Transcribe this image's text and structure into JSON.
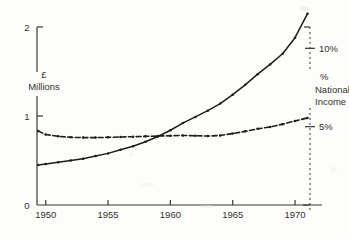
{
  "chart_data": {
    "type": "line",
    "title": "",
    "xlabel": "",
    "ylabel": "£ Millions",
    "y2label": "% National Income",
    "xlim": [
      1949.3,
      1971.2
    ],
    "ylim": [
      0,
      2
    ],
    "y2lim": [
      0,
      11.36
    ],
    "grid": false,
    "legend": "none",
    "xticks": [
      "1950",
      "1955",
      "1960",
      "1965",
      "1970"
    ],
    "xtick_values": [
      1950,
      1955,
      1960,
      1965,
      1970
    ],
    "yticks": [
      "0",
      "1",
      "2"
    ],
    "ytick_values": [
      0,
      1,
      2
    ],
    "y2ticks": [
      "5%",
      "10%"
    ],
    "y2tick_values": [
      5,
      10
    ],
    "series": [
      {
        "name": "£ Millions",
        "axis": "left",
        "style": "solid",
        "marker": "dot",
        "x": [
          1949.4,
          1950,
          1951,
          1952,
          1953,
          1954,
          1955,
          1956,
          1957,
          1958,
          1959,
          1960,
          1961,
          1962,
          1963,
          1964,
          1965,
          1966,
          1967,
          1968,
          1969,
          1970,
          1971
        ],
        "values": [
          0.45,
          0.46,
          0.48,
          0.5,
          0.52,
          0.55,
          0.58,
          0.62,
          0.66,
          0.71,
          0.77,
          0.84,
          0.92,
          0.99,
          1.06,
          1.14,
          1.24,
          1.35,
          1.47,
          1.58,
          1.7,
          1.88,
          2.15
        ]
      },
      {
        "name": "% National Income",
        "axis": "right",
        "style": "dashed",
        "marker": "dot",
        "x": [
          1949.4,
          1950,
          1951,
          1952,
          1953,
          1954,
          1955,
          1956,
          1957,
          1958,
          1959,
          1960,
          1961,
          1962,
          1963,
          1964,
          1965,
          1966,
          1967,
          1968,
          1969,
          1970,
          1971
        ],
        "values": [
          4.72,
          4.5,
          4.38,
          4.32,
          4.3,
          4.3,
          4.32,
          4.34,
          4.36,
          4.38,
          4.4,
          4.42,
          4.44,
          4.42,
          4.4,
          4.44,
          4.56,
          4.7,
          4.86,
          4.98,
          5.16,
          5.36,
          5.56
        ]
      }
    ]
  },
  "axes": {
    "left_title_line1": "£",
    "left_title_line2": "Millions",
    "right_title_line1": "%",
    "right_title_line2": "National",
    "right_title_line3": "Income"
  },
  "colors": {
    "ink": "#1f1d1b",
    "paper": "#fdfdfb",
    "axis": "#3a3734"
  }
}
